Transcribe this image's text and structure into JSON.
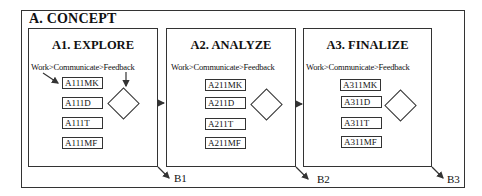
{
  "diagram": {
    "title": "A. CONCEPT",
    "panels": [
      {
        "title": "A1. EXPLORE",
        "flow": "Work>Communicate>Feedback",
        "steps": [
          "A111MK",
          "A111D",
          "A111T",
          "A111MF"
        ],
        "exit_label": "B1"
      },
      {
        "title": "A2. ANALYZE",
        "flow": "Work>Communicate>Feedback",
        "steps": [
          "A211MK",
          "A211D",
          "A211T",
          "A211MF"
        ],
        "exit_label": "B2"
      },
      {
        "title": "A3. FINALIZE",
        "flow": "Work>Communicate>Feedback",
        "steps": [
          "A311MK",
          "A311D",
          "A311T",
          "A311MF"
        ],
        "exit_label": "B3"
      }
    ],
    "colors": {
      "line": "#333333",
      "background": "#ffffff",
      "text": "#111111"
    }
  }
}
